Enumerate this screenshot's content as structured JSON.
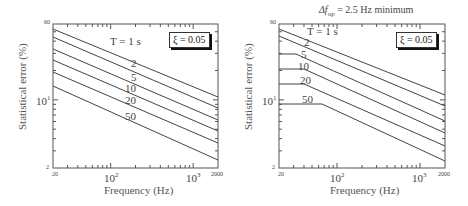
{
  "chart_data": [
    {
      "type": "line",
      "title": "",
      "xlabel": "Frequency (Hz)",
      "ylabel": "Statistical error (%)",
      "xscale": "log",
      "yscale": "log",
      "xlim": [
        20,
        2000
      ],
      "ylim": [
        2,
        60
      ],
      "x_tick_labels": [
        "20",
        "10^2",
        "10^3",
        "2000"
      ],
      "y_tick_labels": [
        "60",
        "10^1",
        "2"
      ],
      "grid": false,
      "legend_box": "ξ = 0.05",
      "annotations": [
        "T = 1 s",
        "2",
        "5",
        "10",
        "20",
        "50"
      ],
      "x": [
        20,
        2000
      ],
      "series": [
        {
          "name": "T = 1 s",
          "values": [
            53,
            10.7
          ]
        },
        {
          "name": "T = 2 s",
          "values": [
            44,
            8.3
          ]
        },
        {
          "name": "T = 5 s",
          "values": [
            33,
            6.3
          ]
        },
        {
          "name": "T = 10 s",
          "values": [
            26,
            4.8
          ]
        },
        {
          "name": "T = 20 s",
          "values": [
            19,
            3.6
          ]
        },
        {
          "name": "T = 50 s",
          "values": [
            14,
            2.4
          ]
        }
      ]
    },
    {
      "type": "line",
      "title": "Δf_op = 2.5 Hz minimum",
      "xlabel": "Frequency (Hz)",
      "ylabel": "Statistical error (%)",
      "xscale": "log",
      "yscale": "log",
      "xlim": [
        20,
        2000
      ],
      "ylim": [
        2,
        60
      ],
      "x_tick_labels": [
        "20",
        "10^2",
        "10^3",
        "2000"
      ],
      "y_tick_labels": [
        "60",
        "10^1",
        "2"
      ],
      "grid": false,
      "legend_box": "ξ = 0.05",
      "annotations": [
        "T = 1 s",
        "2",
        "5",
        "10",
        "20",
        "50"
      ],
      "series": [
        {
          "name": "T = 1 s",
          "points": [
            [
              20,
              53
            ],
            [
              2000,
              10.2
            ]
          ]
        },
        {
          "name": "T = 2 s",
          "points": [
            [
              20,
              45
            ],
            [
              2000,
              7.9
            ]
          ]
        },
        {
          "name": "T = 5 s",
          "points": [
            [
              20,
              30
            ],
            [
              31,
              30
            ],
            [
              2000,
              6.1
            ]
          ]
        },
        {
          "name": "T = 10 s",
          "points": [
            [
              20,
              21
            ],
            [
              38,
              21
            ],
            [
              2000,
              4.6
            ]
          ]
        },
        {
          "name": "T = 20 s",
          "points": [
            [
              20,
              15
            ],
            [
              38,
              15
            ],
            [
              2000,
              3.4
            ]
          ]
        },
        {
          "name": "T = 50 s",
          "points": [
            [
              20,
              9.1
            ],
            [
              62,
              9.1
            ],
            [
              2000,
              2.4
            ]
          ]
        }
      ]
    }
  ],
  "left": {
    "ylabel": "Statistical error (%)",
    "xlabel": "Frequency (Hz)",
    "legend": "ξ = 0.05",
    "y_top": "60",
    "y_mid_base": "10",
    "y_mid_exp": "1",
    "y_bottom": "2",
    "x_left": "20",
    "x_100_base": "10",
    "x_100_exp": "2",
    "x_1000_base": "10",
    "x_1000_exp": "3",
    "x_right": "2000",
    "labels": {
      "t1": "T = 1 s",
      "t2": "2",
      "t5": "5",
      "t10": "10",
      "t20": "20",
      "t50": "50"
    }
  },
  "right": {
    "title": "Δf",
    "title_sub": "op",
    "title_rest": " = 2.5 Hz minimum",
    "ylabel": "Statistical error (%)",
    "xlabel": "Frequency (Hz)",
    "legend": "ξ = 0.05",
    "y_top": "60",
    "y_mid_base": "10",
    "y_mid_exp": "1",
    "y_bottom": "2",
    "x_left": "20",
    "x_100_base": "10",
    "x_100_exp": "2",
    "x_1000_base": "10",
    "x_1000_exp": "3",
    "x_right": "2000",
    "labels": {
      "t1": "T = 1 s",
      "t2": "2",
      "t5": "5",
      "t10": "10",
      "t20": "20",
      "t50": "50"
    }
  }
}
